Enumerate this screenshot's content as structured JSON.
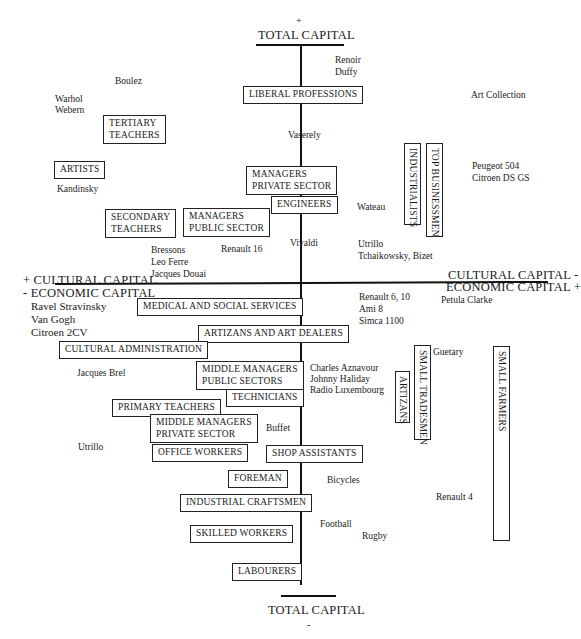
{
  "axes": {
    "top_sign": "+",
    "top_label": "TOTAL CAPITAL",
    "bottom_label": "TOTAL CAPITAL",
    "bottom_sign": "-",
    "left_line1": "+ CULTURAL CAPITAL",
    "left_line2": "- ECONOMIC CAPITAL",
    "right_line1": "CULTURAL CAPITAL -",
    "right_line2": "ECONOMIC CAPITAL +"
  },
  "occupations": {
    "liberal_professions": "LIBERAL PROFESSIONS",
    "tertiary_teachers_1": "TERTIARY",
    "tertiary_teachers_2": "TEACHERS",
    "artists": "ARTISTS",
    "managers_private_1": "MANAGERS",
    "managers_private_2": "PRIVATE SECTOR",
    "engineers": "ENGINEERS",
    "secondary_teachers_1": "SECONDARY",
    "secondary_teachers_2": "TEACHERS",
    "managers_public_1": "MANAGERS",
    "managers_public_2": "PUBLIC SECTOR",
    "industrialists": "INDUSTRIALISTS",
    "top_businessmen": "TOP BUSINESSMEN",
    "medical_social": "MEDICAL AND SOCIAL SERVICES",
    "artizans_art_dealers": "ARTIZANS AND ART DEALERS",
    "cultural_administration": "CULTURAL ADMINISTRATION",
    "middle_managers_public_1": "MIDDLE MANAGERS",
    "middle_managers_public_2": "PUBLIC SECTORS",
    "technicians": "TECHNICIANS",
    "primary_teachers": "PRIMARY TEACHERS",
    "middle_managers_private_1": "MIDDLE MANAGERS",
    "middle_managers_private_2": "PRIVATE SECTOR",
    "office_workers": "OFFICE WORKERS",
    "shop_assistants": "SHOP ASSISTANTS",
    "foreman": "FOREMAN",
    "industrial_craftsmen": "INDUSTRIAL CRAFTSMEN",
    "skilled_workers": "SKILLED WORKERS",
    "labourers": "LABOURERS",
    "artizans": "ARTIZANS",
    "small_tradesmen": "SMALL TRADESMEN",
    "small_farmers": "SMALL FARMERS"
  },
  "tastes": {
    "renoir": "Renoir",
    "duffy": "Duffy",
    "boulez": "Boulez",
    "warhol": "Warhol",
    "webern": "Webern",
    "art_collection": "Art Collection",
    "vaserely": "Vaserely",
    "kandinsky": "Kandinsky",
    "peugeot": "Peugeot 504",
    "citroen_ds": "Citroen DS GS",
    "wateau": "Wateau",
    "bressons": "Bressons",
    "leo_ferre": "Leo Ferre",
    "jacques_douai": "Jacques Douai",
    "renault16": "Renault 16",
    "vivaldi": "Vivaldi",
    "utrillo_top": "Utrillo",
    "tchaikowsky": "Tchaikowsky, Bizet",
    "ravel": "Ravel Stravinsky",
    "van_gogh": "Van Gogh",
    "citroen_2cv": "Citroen 2CV",
    "renault6": "Renault 6, 10",
    "ami8": "Ami 8",
    "simca": "Simca 1100",
    "petula": "Petula Clarke",
    "jacques_brel": "Jacques Brel",
    "aznavour": "Charles Aznavour",
    "haliday": "Johnny Haliday",
    "radio_lux": "Radio Luxembourg",
    "guetary": "Guetary",
    "buffet": "Buffet",
    "utrillo_bottom": "Utrillo",
    "bicycles": "Bicycles",
    "renault4": "Renault 4",
    "football": "Football",
    "rugby": "Rugby"
  }
}
